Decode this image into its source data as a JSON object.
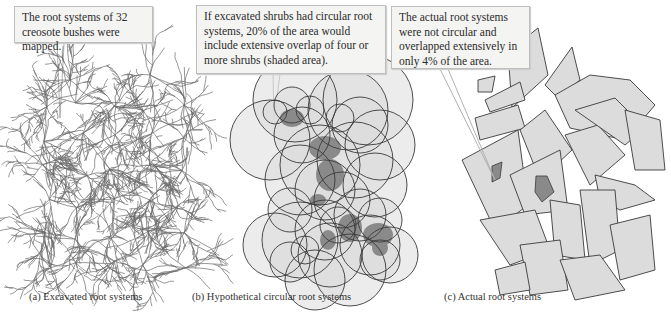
{
  "figure": {
    "panels": [
      {
        "id": "a",
        "callout": "The root systems of 32 creosote bushes were mapped.",
        "caption": "(a)  Excavated root systems"
      },
      {
        "id": "b",
        "callout": "If excavated shrubs had circular root systems, 20% of the area would include extensive overlap of four or more shrubs (shaded area).",
        "caption": "(b)  Hypothetical circular root systems"
      },
      {
        "id": "c",
        "callout": "The actual root systems were not circular and overlapped extensively in only 4% of  the area.",
        "caption": "(c)  Actual root systems"
      }
    ],
    "facts": {
      "shrub_count": 32,
      "hypothetical_overlap_percent": 20,
      "actual_overlap_percent": 4,
      "overlap_threshold": "four or more shrubs"
    },
    "colors": {
      "callout_bg": "#f4f4f2",
      "callout_border": "#bdbdbd",
      "shape_fill": "#dcdcdc",
      "overlap_fill": "#8a8a8a",
      "outline": "#3a3a3a",
      "root_line": "#6a6a6a"
    }
  }
}
